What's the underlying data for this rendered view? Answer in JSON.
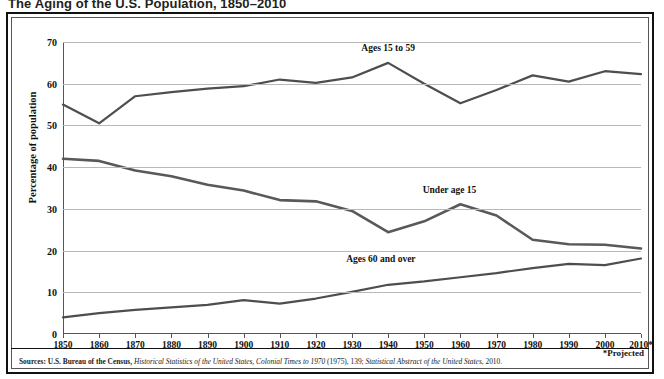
{
  "title": "The Aging of the U.S. Population, 1850–2010",
  "source_note": {
    "prefix": "Sources: U.S. Bureau of the Census, ",
    "italic1": "Historical Statistics of the United States, Colonial Times to 1970",
    "mid": " (1975), 139; ",
    "italic2": "Statistical Abstract of the United States",
    "suffix": ", 2010."
  },
  "projected_note": "*Projected",
  "axis": {
    "ylabel": "Percentage of population",
    "yticks": [
      "0",
      "10",
      "20",
      "30",
      "40",
      "50",
      "60",
      "70"
    ],
    "xticks": [
      "1850",
      "1860",
      "1870",
      "1880",
      "1890",
      "1900",
      "1910",
      "1920",
      "1930",
      "1940",
      "1950",
      "1960",
      "1970",
      "1980",
      "1990",
      "2000",
      "2010*"
    ]
  },
  "series_labels": {
    "ages15to59": "Ages 15 to 59",
    "under15": "Under age 15",
    "ages60over": "Ages 60 and over"
  },
  "colors": {
    "line": "#58595b",
    "line_dark": "#4d4e50",
    "grid": "#b8b8b8",
    "frame": "#111111",
    "text": "#231f20"
  },
  "chart_data": {
    "type": "line",
    "title": "The Aging of the U.S. Population, 1850–2010",
    "xlabel": "",
    "ylabel": "Percentage of population",
    "xlim": [
      1850,
      2010
    ],
    "ylim": [
      0,
      70
    ],
    "ytick_step": 10,
    "grid": true,
    "legend": "inline-labels",
    "x": [
      1850,
      1860,
      1870,
      1880,
      1890,
      1900,
      1910,
      1920,
      1930,
      1940,
      1950,
      1960,
      1970,
      1980,
      1990,
      2000,
      2010
    ],
    "series": [
      {
        "name": "Ages 15 to 59",
        "values": [
          55.0,
          50.5,
          57.0,
          58.0,
          58.8,
          59.4,
          61.0,
          60.2,
          61.5,
          65.0,
          60.0,
          55.3,
          58.5,
          62.0,
          60.5,
          63.0,
          62.3
        ]
      },
      {
        "name": "Under age 15",
        "values": [
          42.0,
          41.5,
          39.2,
          37.8,
          35.8,
          34.4,
          32.1,
          31.8,
          29.5,
          24.4,
          27.0,
          31.1,
          28.4,
          22.6,
          21.5,
          21.4,
          20.5
        ]
      },
      {
        "name": "Ages 60 and over",
        "values": [
          4.0,
          5.0,
          5.8,
          6.4,
          7.0,
          8.1,
          7.3,
          8.5,
          10.1,
          11.8,
          12.6,
          13.6,
          14.6,
          15.8,
          16.8,
          16.5,
          18.1
        ]
      }
    ],
    "annotations": [
      {
        "text": "Ages 15 to 59",
        "x": 1940,
        "y": 68
      },
      {
        "text": "Under age 15",
        "x": 1957,
        "y": 34
      },
      {
        "text": "Ages 60 and over",
        "x": 1938,
        "y": 17.5
      },
      {
        "text": "*Projected",
        "x": 2010,
        "y": -6
      }
    ]
  }
}
